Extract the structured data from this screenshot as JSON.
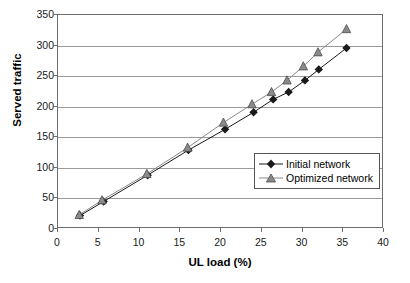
{
  "chart_data": {
    "type": "line",
    "title": "",
    "xlabel": "UL load (%)",
    "ylabel": "Served traffic",
    "xlim": [
      0,
      40
    ],
    "ylim": [
      0,
      350
    ],
    "xticks": [
      0,
      5,
      10,
      15,
      20,
      25,
      30,
      35,
      40
    ],
    "yticks": [
      0,
      50,
      100,
      150,
      200,
      250,
      300,
      350
    ],
    "grid": "horizontal",
    "legend_position": "inside-right",
    "series": [
      {
        "name": "Initial network",
        "marker": "diamond",
        "color": "#1a1a1a",
        "points": [
          [
            2.7,
            22
          ],
          [
            5.6,
            45
          ],
          [
            11.0,
            88
          ],
          [
            16.0,
            129
          ],
          [
            20.5,
            163
          ],
          [
            24.0,
            191
          ],
          [
            26.4,
            212
          ],
          [
            28.3,
            224
          ],
          [
            30.3,
            243
          ],
          [
            32.0,
            261
          ],
          [
            35.4,
            296
          ]
        ]
      },
      {
        "name": "Optimized network",
        "marker": "triangle",
        "color": "#8a8a8a",
        "points": [
          [
            2.6,
            23
          ],
          [
            5.4,
            47
          ],
          [
            10.9,
            90
          ],
          [
            15.9,
            133
          ],
          [
            20.3,
            174
          ],
          [
            23.8,
            204
          ],
          [
            26.2,
            224
          ],
          [
            28.1,
            243
          ],
          [
            30.1,
            266
          ],
          [
            31.9,
            289
          ],
          [
            35.4,
            327
          ]
        ]
      }
    ]
  }
}
